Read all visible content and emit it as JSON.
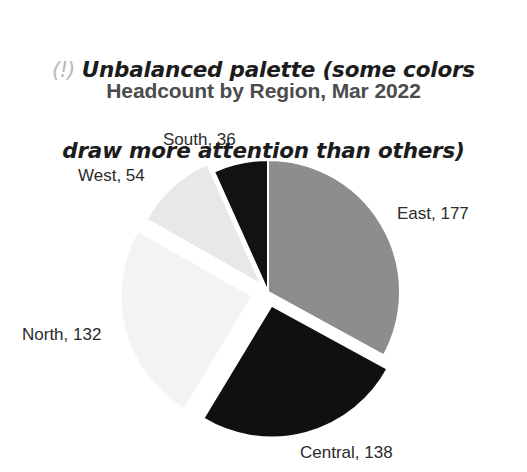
{
  "annotation": {
    "icon": "warning-exclamation-icon",
    "icon_glyph": "(!)",
    "line1": "Unbalanced palette (some colors",
    "line2": "draw more attention than others)",
    "icon_color": "#b9b9b9",
    "text_color": "#1c1c1c"
  },
  "chart_data": {
    "type": "pie",
    "title": "Headcount by Region, Mar 2022",
    "xlabel": "",
    "ylabel": "",
    "total": 537,
    "start_angle_deg": 0,
    "direction": "clockwise",
    "legend": "none",
    "grid": false,
    "categories": [
      "East",
      "Central",
      "North",
      "West",
      "South"
    ],
    "values": [
      177,
      138,
      132,
      54,
      36
    ],
    "labels": [
      "East, 177",
      "Central, 138",
      "North, 132",
      "West, 54",
      "South, 36"
    ],
    "colors": [
      "#8d8d8d",
      "#101010",
      "#f3f3f3",
      "#e8e8e8",
      "#121212"
    ],
    "slices": [
      {
        "name": "East",
        "value": 177,
        "label": "East, 177",
        "color": "#8d8d8d",
        "percent": 33.0,
        "angle_deg": 118.7,
        "start_deg": 0,
        "end_deg": 118.7,
        "exploded": false,
        "explode_px": 0,
        "label_x": 397,
        "label_y": 204
      },
      {
        "name": "Central",
        "value": 138,
        "label": "Central, 138",
        "color": "#101010",
        "percent": 25.7,
        "angle_deg": 92.5,
        "start_deg": 118.7,
        "end_deg": 211.2,
        "exploded": true,
        "explode_px": 14,
        "label_x": 300,
        "label_y": 443
      },
      {
        "name": "North",
        "value": 132,
        "label": "North, 132",
        "color": "#f3f3f3",
        "percent": 24.6,
        "angle_deg": 88.5,
        "start_deg": 211.2,
        "end_deg": 299.7,
        "exploded": true,
        "explode_px": 16,
        "label_x": 22,
        "label_y": 325
      },
      {
        "name": "West",
        "value": 54,
        "label": "West, 54",
        "color": "#e8e8e8",
        "percent": 10.1,
        "angle_deg": 36.2,
        "start_deg": 299.7,
        "end_deg": 335.9,
        "exploded": true,
        "explode_px": 10,
        "label_x": 78,
        "label_y": 166
      },
      {
        "name": "South",
        "value": 36,
        "label": "South, 36",
        "color": "#121212",
        "percent": 6.7,
        "angle_deg": 24.1,
        "start_deg": 335.9,
        "end_deg": 360,
        "exploded": false,
        "explode_px": 0,
        "label_x": 163,
        "label_y": 130
      }
    ],
    "geometry": {
      "center_x": 268,
      "center_y": 292,
      "radius": 132
    }
  },
  "canvas": {
    "background": "#ffffff",
    "width": 527,
    "height": 472
  }
}
